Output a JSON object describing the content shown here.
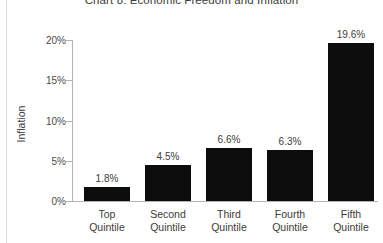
{
  "chart_data": {
    "type": "bar",
    "title": "Chart 8: Economic Freedom and Inflation",
    "xlabel": "",
    "ylabel": "Inflation",
    "categories": [
      "Top Quintile",
      "Second Quintile",
      "Third Quintile",
      "Fourth Quintile",
      "Fifth Quintile"
    ],
    "category_lines": [
      [
        "Top",
        "Quintile"
      ],
      [
        "Second",
        "Quintile"
      ],
      [
        "Third",
        "Quintile"
      ],
      [
        "Fourth",
        "Quintile"
      ],
      [
        "Fifth",
        "Quintile"
      ]
    ],
    "values": [
      1.8,
      4.5,
      6.6,
      6.3,
      19.6
    ],
    "value_labels": [
      "1.8%",
      "4.5%",
      "6.6%",
      "6.3%",
      "19.6%"
    ],
    "ylim": [
      0,
      20
    ],
    "yticks": [
      0,
      5,
      10,
      15,
      20
    ],
    "ytick_labels": [
      "0%",
      "5%",
      "10%",
      "15%",
      "20%"
    ],
    "grid": false,
    "legend": null,
    "bar_color": "#0d0d0d",
    "axis_color": "#b4b4b4",
    "text_color": "#3b3b3b",
    "background": "#ffffff"
  }
}
